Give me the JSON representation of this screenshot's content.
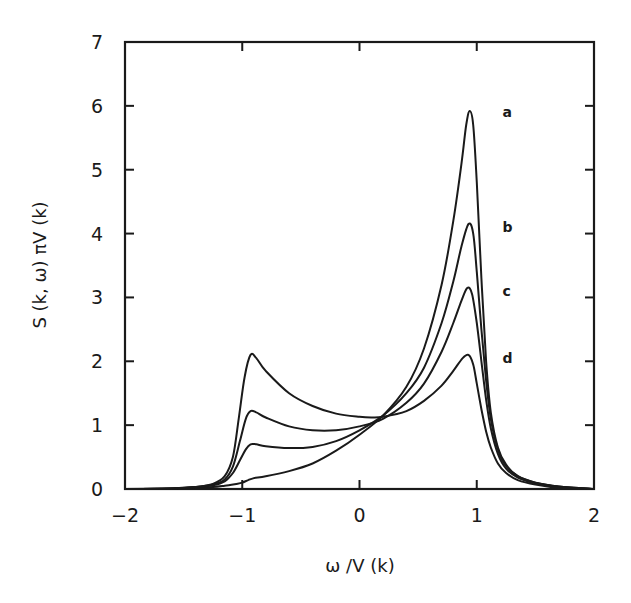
{
  "chart_data": {
    "type": "line",
    "title": "",
    "xlabel": "ω /V (k)",
    "ylabel": "S (k, ω) πV (k)",
    "xlim": [
      -2,
      2
    ],
    "ylim": [
      0,
      7
    ],
    "xticks": [
      -2,
      -1,
      0,
      1,
      2
    ],
    "yticks": [
      0,
      1,
      2,
      3,
      4,
      5,
      6,
      7
    ],
    "xtick_labels": [
      "−2",
      "−1",
      "0",
      "1",
      "2"
    ],
    "ytick_labels": [
      "0",
      "1",
      "2",
      "3",
      "4",
      "5",
      "6",
      "7"
    ],
    "grid": false,
    "legend": "inline labels at right of peaks",
    "series": [
      {
        "name": "a",
        "label_pos": [
          1.22,
          5.9
        ],
        "x": [
          -2.0,
          -1.6,
          -1.4,
          -1.25,
          -1.15,
          -1.05,
          -1.0,
          -0.95,
          -0.9,
          -0.8,
          -0.6,
          -0.4,
          -0.2,
          0.0,
          0.2,
          0.4,
          0.55,
          0.7,
          0.8,
          0.87,
          0.91,
          0.94,
          0.97,
          1.0,
          1.04,
          1.08,
          1.12,
          1.18,
          1.25,
          1.35,
          1.5,
          1.7,
          2.0
        ],
        "y": [
          0.0,
          0.01,
          0.02,
          0.03,
          0.05,
          0.08,
          0.1,
          0.14,
          0.17,
          0.2,
          0.28,
          0.4,
          0.6,
          0.85,
          1.15,
          1.6,
          2.2,
          3.2,
          4.2,
          5.1,
          5.7,
          5.92,
          5.7,
          4.8,
          3.3,
          2.0,
          1.2,
          0.65,
          0.38,
          0.2,
          0.1,
          0.04,
          0.0
        ]
      },
      {
        "name": "b",
        "label_pos": [
          1.22,
          4.1
        ],
        "x": [
          -2.0,
          -1.6,
          -1.4,
          -1.25,
          -1.15,
          -1.08,
          -1.02,
          -0.97,
          -0.93,
          -0.88,
          -0.8,
          -0.6,
          -0.4,
          -0.2,
          0.0,
          0.2,
          0.4,
          0.55,
          0.7,
          0.8,
          0.87,
          0.93,
          0.97,
          1.0,
          1.04,
          1.08,
          1.12,
          1.18,
          1.25,
          1.35,
          1.5,
          1.7,
          2.0
        ],
        "y": [
          0.0,
          0.01,
          0.03,
          0.06,
          0.12,
          0.25,
          0.45,
          0.62,
          0.7,
          0.7,
          0.67,
          0.64,
          0.66,
          0.75,
          0.92,
          1.15,
          1.5,
          1.9,
          2.6,
          3.25,
          3.8,
          4.15,
          4.0,
          3.4,
          2.5,
          1.7,
          1.1,
          0.62,
          0.36,
          0.2,
          0.1,
          0.04,
          0.0
        ]
      },
      {
        "name": "c",
        "label_pos": [
          1.22,
          3.1
        ],
        "x": [
          -2.0,
          -1.6,
          -1.4,
          -1.25,
          -1.15,
          -1.08,
          -1.02,
          -0.97,
          -0.93,
          -0.88,
          -0.8,
          -0.6,
          -0.4,
          -0.2,
          0.0,
          0.2,
          0.4,
          0.55,
          0.7,
          0.8,
          0.87,
          0.92,
          0.96,
          1.0,
          1.04,
          1.08,
          1.12,
          1.18,
          1.25,
          1.35,
          1.5,
          1.7,
          2.0
        ],
        "y": [
          0.0,
          0.01,
          0.03,
          0.07,
          0.15,
          0.35,
          0.75,
          1.1,
          1.22,
          1.2,
          1.12,
          0.98,
          0.92,
          0.92,
          0.98,
          1.1,
          1.35,
          1.65,
          2.15,
          2.6,
          2.95,
          3.15,
          3.05,
          2.6,
          2.0,
          1.4,
          0.95,
          0.55,
          0.32,
          0.18,
          0.09,
          0.03,
          0.0
        ]
      },
      {
        "name": "d",
        "label_pos": [
          1.22,
          2.05
        ],
        "x": [
          -2.0,
          -1.6,
          -1.4,
          -1.25,
          -1.15,
          -1.08,
          -1.03,
          -0.98,
          -0.93,
          -0.88,
          -0.8,
          -0.6,
          -0.4,
          -0.2,
          0.0,
          0.1,
          0.2,
          0.4,
          0.55,
          0.7,
          0.8,
          0.88,
          0.93,
          0.97,
          1.0,
          1.04,
          1.08,
          1.12,
          1.18,
          1.25,
          1.35,
          1.5,
          1.7,
          2.0
        ],
        "y": [
          0.0,
          0.01,
          0.03,
          0.08,
          0.2,
          0.5,
          1.1,
          1.75,
          2.1,
          2.05,
          1.85,
          1.5,
          1.3,
          1.18,
          1.13,
          1.12,
          1.13,
          1.22,
          1.38,
          1.62,
          1.85,
          2.05,
          2.1,
          1.95,
          1.65,
          1.25,
          0.9,
          0.65,
          0.4,
          0.25,
          0.14,
          0.07,
          0.02,
          0.0
        ]
      }
    ]
  },
  "layout": {
    "plot_left": 125,
    "plot_top": 42,
    "plot_right": 594,
    "plot_bottom": 489
  }
}
